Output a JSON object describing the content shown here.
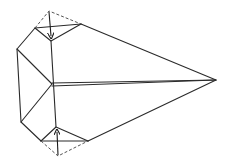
{
  "diagram": {
    "title": "Origami folding step: fold top and bottom corners inward",
    "type": "origami-diagram",
    "colors": {
      "line": "#2a2a2a",
      "dashed": "#555555",
      "background": "#ffffff"
    },
    "elements": [
      {
        "name": "kite-outline",
        "kind": "solid"
      },
      {
        "name": "center-crease",
        "kind": "solid-double"
      },
      {
        "name": "top-fold-flap",
        "kind": "dashed",
        "arrow": "down"
      },
      {
        "name": "bottom-fold-flap",
        "kind": "dashed",
        "arrow": "up"
      }
    ]
  }
}
